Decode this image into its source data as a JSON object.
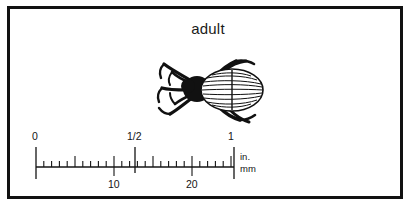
{
  "plate": {
    "caption": "adult",
    "border_color": "#111111",
    "background_color": "#ffffff",
    "ink_color": "#141414"
  },
  "specimen": {
    "name": "beetle-illustration",
    "description": "adult beetle, dorsal view",
    "body_fill": "#ffffff",
    "outline_color": "#111111",
    "head_fill": "#111111",
    "elytra_stripe_count": 12,
    "leg_count": 6,
    "antenna_count": 2
  },
  "ruler": {
    "inch_scale": {
      "unit_label": "in.",
      "labels": [
        "0",
        "1/2",
        "1"
      ],
      "positions": [
        0,
        50,
        100
      ],
      "minor_per_major": 8
    },
    "mm_scale": {
      "unit_label": "mm",
      "labels": [
        "10",
        "20"
      ],
      "positions": [
        39.37,
        78.74
      ],
      "total_mm": 25.4,
      "tick_every_mm": 1,
      "major_every_mm": 5
    }
  }
}
